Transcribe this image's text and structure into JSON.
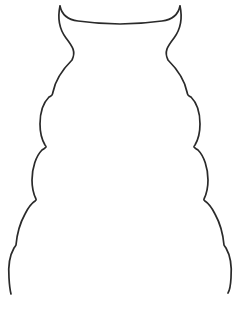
{
  "canvas": {
    "width": 241,
    "height": 312,
    "background_color": "#ffffff",
    "description": "horned-creature-outline-coloring-template"
  },
  "drawing": {
    "name": "horned creature outline",
    "stroke_color": "#2a2a2a",
    "fill_color": "none",
    "stroke_width": 1.7,
    "open_at_bottom": true,
    "symmetry": "bilateral-vertical",
    "horns": {
      "count": 2,
      "left_tip": {
        "x": 60,
        "y": 6
      },
      "right_tip": {
        "x": 180,
        "y": 6
      },
      "top_dip_center": {
        "x": 120,
        "y": 24
      }
    },
    "body_tiers": [
      {
        "index": 1,
        "label": "head-tier",
        "cusp_left": {
          "x": 52,
          "y": 95
        },
        "cusp_right": {
          "x": 188,
          "y": 95
        },
        "half_width": 34
      },
      {
        "index": 2,
        "label": "upper-body-tier",
        "cusp_left": {
          "x": 46,
          "y": 147
        },
        "cusp_right": {
          "x": 194,
          "y": 147
        },
        "half_width": 44
      },
      {
        "index": 3,
        "label": "mid-body-tier",
        "cusp_left": {
          "x": 36,
          "y": 200
        },
        "cusp_right": {
          "x": 205,
          "y": 200
        },
        "half_width": 55
      },
      {
        "index": 4,
        "label": "lower-body-tier",
        "cusp_left": {
          "x": 24,
          "y": 245
        },
        "cusp_right": {
          "x": 216,
          "y": 245
        },
        "half_width": 67
      }
    ],
    "open_ends": {
      "left_end": {
        "x": 11,
        "y": 294
      },
      "right_end": {
        "x": 228,
        "y": 293
      }
    },
    "path_left": "M 60 6 C 57 20 60 30 66 38 C 73 47 76 52 72 60 C 62 70 55 82 53 92 C 52.6 94 52.4 94.6 52 95 C 51.2 96 50.4 96 49 97 C 43 103 40 114 40 124 C 40 133 42 140 45 145 C 46 146 46.4 146.4 46 147 C 45 148.4 44 148.6 42 150 C 36 156 32 168 32 180 C 32 188 34 195 36 199 C 36.6 200 36.4 200 35 201 C 32 203 28 208 25 214 C 20 223 17 234 16 245 C 15.6 246 15.4 246 14 248 C 10 255 8 266 9 278 C 9.4 285 10 290 11 294",
    "path_right": "M 180 6 C 183 20 180 30 174 38 C 167 47 164 52 168 60 C 178 70 185 82 187 92 C 187.4 94 187.6 94.6 188 95 C 188.8 96 189.6 96 191 97 C 197 103 200 114 200 124 C 200 133 198 140 195 145 C 194 146 193.6 146.4 194 147 C 195 148.4 196 148.6 198 150 C 204 156 208 168 208 180 C 208 188 206 195 204 199 C 203.4 200 203.6 200 205 201 C 208 203 212 208 215 214 C 220 223 223 234 224 245 C 224.4 246 224.6 246 226 248 C 230 255 232 266 231 278 C 230.6 285 230 290 228 293",
    "path_top": "M 60 6 C 62 16 70 20 78 21 C 92 23 106 24 120 24 C 134 24 148 23 162 21 C 170 20 178 16 180 6"
  }
}
